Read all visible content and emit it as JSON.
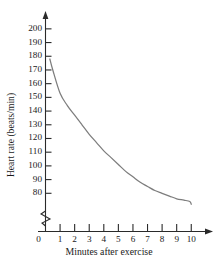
{
  "chart_data": {
    "type": "line",
    "title": "",
    "subtitle": "",
    "xlabel": "Minutes after exercise",
    "ylabel": "Heart rate (beats/min)",
    "xlim": [
      0,
      10.6
    ],
    "ylim": [
      70,
      205
    ],
    "y_axis_break": true,
    "y_axis_break_note": "zigzag break below 80",
    "grid": false,
    "legend": null,
    "xticks": [
      0,
      1,
      2,
      3,
      4,
      5,
      6,
      7,
      8,
      9,
      10
    ],
    "xtick_labels": [
      "0",
      "1",
      "2",
      "3",
      "4",
      "5",
      "6",
      "7",
      "8",
      "9",
      "10"
    ],
    "yticks": [
      80,
      90,
      100,
      110,
      120,
      130,
      140,
      150,
      160,
      170,
      180,
      190,
      200
    ],
    "ytick_labels": [
      "80",
      "90",
      "100",
      "110",
      "120",
      "130",
      "140",
      "150",
      "160",
      "170",
      "180",
      "190",
      "200"
    ],
    "series": [
      {
        "name": "Heart rate",
        "color": "#7d7d7d",
        "x": [
          0.3,
          0.5,
          1,
          1.5,
          2,
          2.5,
          3,
          3.5,
          4,
          4.5,
          5,
          5.5,
          6,
          6.5,
          7,
          7.5,
          8,
          8.5,
          9,
          9.5,
          9.9,
          10
        ],
        "values": [
          178,
          170,
          153,
          144,
          137,
          130,
          123,
          117,
          111,
          106,
          101,
          96,
          92,
          88,
          85,
          82,
          80,
          78,
          76,
          75,
          74,
          72
        ]
      }
    ],
    "annotations": []
  },
  "axes": {
    "x_arrow": "right-arrowhead",
    "y_arrow": "up-arrowhead",
    "break_symbol": "zigzag-break"
  }
}
